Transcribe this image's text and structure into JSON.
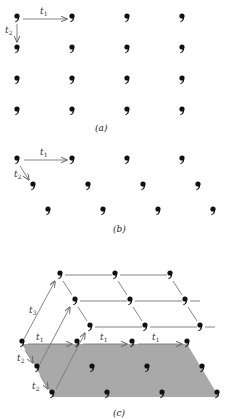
{
  "figure": {
    "top_cutoff_text": "",
    "motif_glyph": "‚",
    "colors": {
      "motif": "#111111",
      "arrow": "#777777",
      "lattice_line": "#666666",
      "plane_fill": "#a9a9a9",
      "label": "#333333"
    },
    "panels": [
      {
        "id": "a",
        "caption": "(a)",
        "description": "2D rectangular lattice, 4 rows x 4 columns of motifs",
        "translation_labels": {
          "t1": "t",
          "t1_sub": "1",
          "t2": "t",
          "t2_sub": "2"
        }
      },
      {
        "id": "b",
        "caption": "(b)",
        "description": "2D oblique lattice, 3 rows x 4 columns, rows offset right",
        "translation_labels": {
          "t1": "t",
          "t1_sub": "1",
          "t2": "t",
          "t2_sub": "2"
        }
      },
      {
        "id": "c",
        "caption": "(c)",
        "description": "3D lattice: shaded base plane (3x4 motifs) with upper layer connected by t3",
        "translation_labels": {
          "t1": "t",
          "t1_sub": "1",
          "t2": "t",
          "t2_sub": "2",
          "t3": "t",
          "t3_sub": "3"
        }
      }
    ]
  }
}
